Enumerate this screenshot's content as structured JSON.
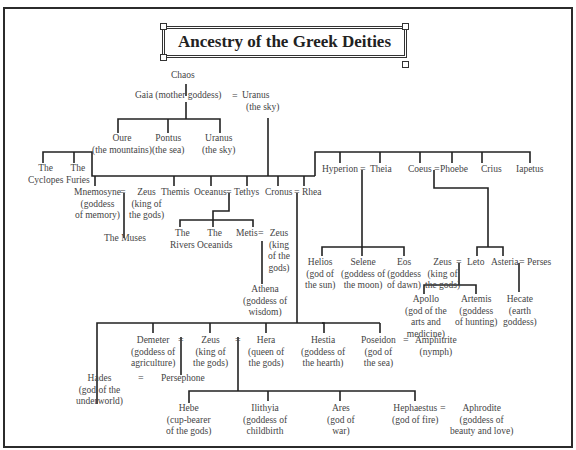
{
  "title": "Ancestry of the Greek Deities",
  "nodes": {
    "chaos": {
      "name": "Chaos"
    },
    "gaia": {
      "name": "Gaia (mother goddess)"
    },
    "uranus_top": {
      "name": "Uranus",
      "desc": "(the sky)"
    },
    "oure": {
      "name": "Oure",
      "desc": "(the mountains)"
    },
    "pontus": {
      "name": "Pontus",
      "desc": "(the sea)"
    },
    "uranus_child": {
      "name": "Uranus",
      "desc": "(the sky)"
    },
    "cyclopes": {
      "name": "The",
      "desc": "Cyclopes"
    },
    "furies": {
      "name": "The",
      "desc": "Furies"
    },
    "mnemosyne": {
      "name": "Mnemosyne",
      "desc1": "(goddess",
      "desc2": "of memory)"
    },
    "zeus_a": {
      "name": "Zeus",
      "desc1": "(king of",
      "desc2": "the gods)"
    },
    "muses": {
      "name": "The Muses"
    },
    "themis": {
      "name": "Themis"
    },
    "oceanus": {
      "name": "Oceanus"
    },
    "tethys": {
      "name": "Tethys"
    },
    "cronus": {
      "name": "Cronus"
    },
    "rhea": {
      "name": "Rhea"
    },
    "rivers": {
      "name": "The",
      "desc": "Rivers"
    },
    "oceanids": {
      "name": "The",
      "desc": "Oceanids"
    },
    "metis": {
      "name": "Metis"
    },
    "zeus_b": {
      "name": "Zeus",
      "desc1": "(king",
      "desc2": "of the",
      "desc3": "gods)"
    },
    "athena": {
      "name": "Athena",
      "desc1": "(goddess of",
      "desc2": "wisdom)"
    },
    "hyperion": {
      "name": "Hyperion"
    },
    "theia": {
      "name": "Theia"
    },
    "coeus": {
      "name": "Coeus"
    },
    "phoebe": {
      "name": "Phoebe"
    },
    "crius": {
      "name": "Crius"
    },
    "iapetus": {
      "name": "Iapetus"
    },
    "helios": {
      "name": "Helios",
      "desc1": "(god of",
      "desc2": "the sun)"
    },
    "selene": {
      "name": "Selene",
      "desc1": "(goddess of",
      "desc2": "the moon)"
    },
    "eos": {
      "name": "Eos",
      "desc1": "(goddess",
      "desc2": "of dawn)"
    },
    "zeus_c": {
      "name": "Zeus",
      "desc1": "(king of",
      "desc2": "the gods)"
    },
    "leto": {
      "name": "Leto"
    },
    "asteria": {
      "name": "Asteria"
    },
    "perses": {
      "name": "Perses"
    },
    "apollo": {
      "name": "Apollo",
      "desc1": "(god of the",
      "desc2": "arts and",
      "desc3": "medicine)"
    },
    "artemis": {
      "name": "Artemis",
      "desc1": "(goddess",
      "desc2": "of hunting)"
    },
    "hecate": {
      "name": "Hecate",
      "desc1": "(earth",
      "desc2": "goddess)"
    },
    "demeter": {
      "name": "Demeter",
      "desc1": "(goddess of",
      "desc2": "agriculture)"
    },
    "zeus_d": {
      "name": "Zeus",
      "desc1": "(king of",
      "desc2": "the gods)"
    },
    "hera": {
      "name": "Hera",
      "desc1": "(queen of",
      "desc2": "the gods)"
    },
    "hestia": {
      "name": "Hestia",
      "desc1": "(goddess of",
      "desc2": "the hearth)"
    },
    "poseidon": {
      "name": "Poseidon",
      "desc1": "(god of",
      "desc2": "the sea)"
    },
    "amphitrite": {
      "name": "Amphitrite",
      "desc": "(nymph)"
    },
    "hades": {
      "name": "Hades",
      "desc1": "(god of the",
      "desc2": "underworld)"
    },
    "persephone": {
      "name": "Persephone"
    },
    "hebe": {
      "name": "Hebe",
      "desc1": "(cup-bearer",
      "desc2": "of the gods)"
    },
    "ilithyia": {
      "name": "Ilithyia",
      "desc1": "(goddess of",
      "desc2": "childbirth"
    },
    "ares": {
      "name": "Ares",
      "desc1": "(god of",
      "desc2": "war)"
    },
    "hephaestus": {
      "name": "Hephaestus",
      "desc": "(god of fire)"
    },
    "aphrodite": {
      "name": "Aphrodite",
      "desc1": "(goddess of",
      "desc2": "beauty and love)"
    }
  },
  "symbols": {
    "marriage": "="
  }
}
